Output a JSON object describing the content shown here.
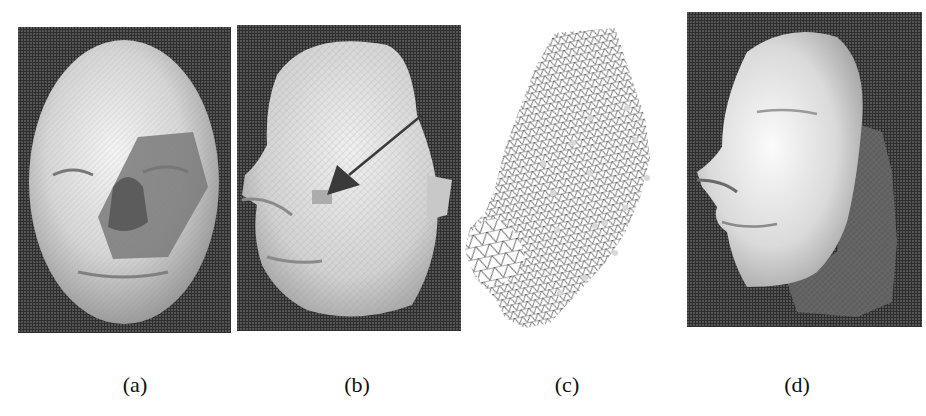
{
  "figure": {
    "panels": [
      {
        "id": "a",
        "caption": "(a)",
        "description": "Frontal face scan with darker nose/cheek region",
        "background": "#2e2e2e"
      },
      {
        "id": "b",
        "caption": "(b)",
        "description": "Three-quarter view face scan with arrow pointing to patch near eye",
        "background": "#2e2e2e"
      },
      {
        "id": "c",
        "caption": "(c)",
        "description": "Triangular wireframe mesh of face region with highlighted vertices",
        "background": "#ffffff"
      },
      {
        "id": "d",
        "caption": "(d)",
        "description": "Side view face scan with darker mesh overlay on cheek",
        "background": "#2e2e2e"
      }
    ],
    "colors": {
      "panel_background": "#2e2e2e",
      "surface_light": "#e8e8e8",
      "surface_mid": "#b4b4b4",
      "surface_dark": "#6a6a6a",
      "mesh_line": "#333333",
      "arrow": "#3a3a3a",
      "caption_text": "#111111"
    }
  }
}
